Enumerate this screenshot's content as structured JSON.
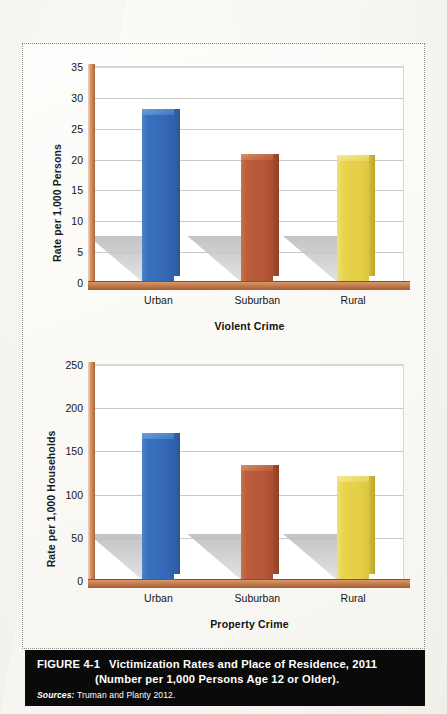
{
  "figure": {
    "caption_label": "FIGURE 4-1",
    "caption_line_1": "Victimization Rates and Place of Residence, 2011",
    "caption_line_2": "(Number per 1,000 Persons Age 12 or Older).",
    "source_word": "Sources:",
    "source_text": "Truman and Planty 2012."
  },
  "colors": {
    "urban": "#3a70be",
    "suburban": "#bb5c3c",
    "rural": "#e8d44d",
    "axis": "#c07a4c",
    "gridline": "#c9c9c6",
    "caption_background": "#0a0a0a",
    "caption_text": "#ffffff"
  },
  "chart_data": [
    {
      "type": "bar",
      "title": "Violent Crime",
      "xlabel": "Violent Crime",
      "ylabel": "Rate per 1,000 Persons",
      "categories": [
        "Urban",
        "Suburban",
        "Rural"
      ],
      "values": [
        28,
        20.7,
        20.6
      ],
      "series": [
        {
          "name": "Violent victimization rate",
          "values": [
            28,
            20.7,
            20.6
          ]
        }
      ],
      "ylim": [
        0,
        35
      ],
      "yticks": [
        0,
        5,
        10,
        15,
        20,
        25,
        30,
        35
      ],
      "ytick_labels": [
        "0",
        "5",
        "10",
        "15",
        "20",
        "25",
        "30",
        "35"
      ],
      "grid": true,
      "legend": "none",
      "bar_colors": [
        "#3a70be",
        "#bb5c3c",
        "#e8d44d"
      ]
    },
    {
      "type": "bar",
      "title": "Property Crime",
      "xlabel": "Property Crime",
      "ylabel": "Rate per 1,000 Households",
      "categories": [
        "Urban",
        "Suburban",
        "Rural"
      ],
      "values": [
        170,
        133,
        120
      ],
      "series": [
        {
          "name": "Property victimization rate",
          "values": [
            170,
            133,
            120
          ]
        }
      ],
      "ylim": [
        0,
        250
      ],
      "yticks": [
        0,
        50,
        100,
        150,
        200,
        250
      ],
      "ytick_labels": [
        "0",
        "50",
        "100",
        "150",
        "200",
        "250"
      ],
      "grid": true,
      "legend": "none",
      "bar_colors": [
        "#3a70be",
        "#bb5c3c",
        "#e8d44d"
      ]
    }
  ]
}
